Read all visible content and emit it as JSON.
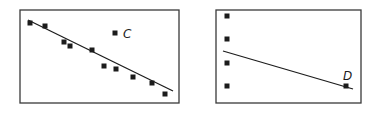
{
  "panels": [
    {
      "id": "left",
      "outlier_label": "C",
      "description": "Scatter plot with negative trend line; outlier C lies far above the line",
      "frame": {
        "x": 20,
        "y": 10,
        "w": 159,
        "h": 93
      },
      "points": [
        [
          30,
          23
        ],
        [
          45,
          26
        ],
        [
          64,
          42
        ],
        [
          70,
          46
        ],
        [
          92,
          50
        ],
        [
          104,
          66
        ],
        [
          116,
          69
        ],
        [
          133,
          77
        ],
        [
          152,
          83
        ],
        [
          165,
          94
        ]
      ],
      "outlier": [
        115,
        33
      ],
      "line": [
        [
          28,
          20
        ],
        [
          173,
          91
        ]
      ]
    },
    {
      "id": "right",
      "outlier_label": "D",
      "description": "Four vertically stacked points at left plus point D at far right; regression line pulled toward D",
      "frame": {
        "x": 216,
        "y": 10,
        "w": 145,
        "h": 93
      },
      "points": [
        [
          227,
          16
        ],
        [
          227,
          39
        ],
        [
          227,
          63
        ],
        [
          227,
          86
        ]
      ],
      "outlier": [
        346,
        86
      ],
      "line": [
        [
          223,
          51
        ],
        [
          353,
          89
        ]
      ]
    }
  ],
  "chart_data": [
    {
      "type": "scatter",
      "title": "",
      "annotations": [
        "C"
      ],
      "series": [
        {
          "name": "points",
          "values": [
            [
              1,
              9.1
            ],
            [
              2,
              8.8
            ],
            [
              3,
              7.5
            ],
            [
              3.4,
              7.2
            ],
            [
              4.9,
              6.8
            ],
            [
              5.6,
              5.5
            ],
            [
              6.4,
              5.3
            ],
            [
              7.5,
              4.6
            ],
            [
              8.7,
              4.1
            ],
            [
              9.6,
              3.2
            ]
          ]
        },
        {
          "name": "C (outlier)",
          "values": [
            [
              6.4,
              8.3
            ]
          ]
        }
      ],
      "trend_line": {
        "slope": "negative",
        "from": [
          0.8,
          9.4
        ],
        "to": [
          9.9,
          3.6
        ]
      },
      "xlabel": "",
      "ylabel": "",
      "grid": false
    },
    {
      "type": "scatter",
      "title": "",
      "annotations": [
        "D"
      ],
      "series": [
        {
          "name": "points",
          "values": [
            [
              1,
              9.4
            ],
            [
              1,
              6.9
            ],
            [
              1,
              4.3
            ],
            [
              1,
              1.8
            ]
          ]
        },
        {
          "name": "D (influential point)",
          "values": [
            [
              9.3,
              1.8
            ]
          ]
        }
      ],
      "trend_line": {
        "slope": "negative",
        "from": [
          0.5,
          5.6
        ],
        "to": [
          9.9,
          1.5
        ]
      },
      "xlabel": "",
      "ylabel": "",
      "grid": false
    }
  ]
}
